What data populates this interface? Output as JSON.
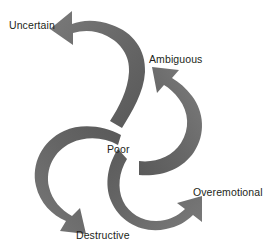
{
  "diagram": {
    "type": "radial-spiral-arrow-diagram",
    "center": {
      "label": "Poor",
      "id": "poor"
    },
    "arrow_color": "#6b6b6b",
    "arrow_color_dark": "#5d5d5d",
    "text_color": "#231f20",
    "background_color": "#ffffff",
    "outcomes": [
      {
        "id": "uncertain",
        "label": "Uncertain",
        "position": "top-left",
        "arrow_direction": "up-left"
      },
      {
        "id": "ambiguous",
        "label": "Ambiguous",
        "position": "top-right",
        "arrow_direction": "up"
      },
      {
        "id": "overemotional",
        "label": "Overemotional",
        "position": "bottom-right",
        "arrow_direction": "up-right"
      },
      {
        "id": "destructive",
        "label": "Destructive",
        "position": "bottom-left",
        "arrow_direction": "down-left"
      }
    ]
  }
}
